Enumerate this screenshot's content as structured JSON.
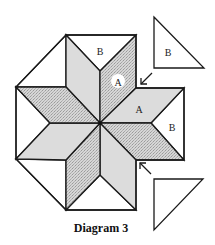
{
  "diagram": {
    "caption": "Diagram 3",
    "colors": {
      "plain_fill": "#dcdcdc",
      "textured_fill": "#cfcfcf",
      "outline": "#1a1a1a",
      "background": "#ffffff"
    },
    "labels": {
      "b_top": "B",
      "a_circled": "A",
      "a_right": "A",
      "b_right": "B",
      "b_triangle": "B"
    },
    "pieces": {
      "star_diamonds": 8,
      "diamond_label": "A",
      "triangle_label": "B"
    },
    "arrows": [
      {
        "direction": "down-left",
        "target": "upper-right notch"
      },
      {
        "direction": "up-left",
        "target": "lower-right notch"
      }
    ]
  }
}
